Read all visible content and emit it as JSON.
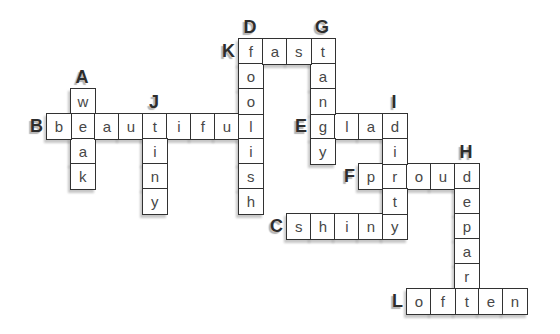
{
  "page": {
    "background": "#ffffff"
  },
  "colors": {
    "cell_bg": "#ffffff",
    "cell_border": "#323232",
    "letter": "#474747",
    "label": "#2d2d2d",
    "shadow": "#9a9a9a"
  },
  "grid": {
    "offset_x": 22,
    "offset_y": 13,
    "cell_w": 24,
    "cell_h": 25,
    "cols": 21,
    "rows": 12
  },
  "puzzle": {
    "words": [
      {
        "label": "A",
        "answer": "weak",
        "direction": "down",
        "col": 2,
        "row": 3
      },
      {
        "label": "B",
        "answer": "beautiful",
        "direction": "across",
        "col": 1,
        "row": 4
      },
      {
        "label": "C",
        "answer": "shiny",
        "direction": "across",
        "col": 11,
        "row": 8
      },
      {
        "label": "D",
        "answer": "foolish",
        "direction": "down",
        "col": 9,
        "row": 1
      },
      {
        "label": "E",
        "answer": "glad",
        "direction": "across",
        "col": 12,
        "row": 4
      },
      {
        "label": "F",
        "answer": "proud",
        "direction": "across",
        "col": 14,
        "row": 6
      },
      {
        "label": "G",
        "answer": "tangy",
        "direction": "down",
        "col": 12,
        "row": 1
      },
      {
        "label": "H",
        "answer": "depart",
        "direction": "down",
        "col": 18,
        "row": 6
      },
      {
        "label": "I",
        "answer": "dirty",
        "direction": "down",
        "col": 15,
        "row": 4
      },
      {
        "label": "J",
        "answer": "tiny",
        "direction": "down",
        "col": 5,
        "row": 4
      },
      {
        "label": "K",
        "answer": "fast",
        "direction": "across",
        "col": 9,
        "row": 1
      },
      {
        "label": "L",
        "answer": "often",
        "direction": "across",
        "col": 16,
        "row": 11
      }
    ]
  }
}
